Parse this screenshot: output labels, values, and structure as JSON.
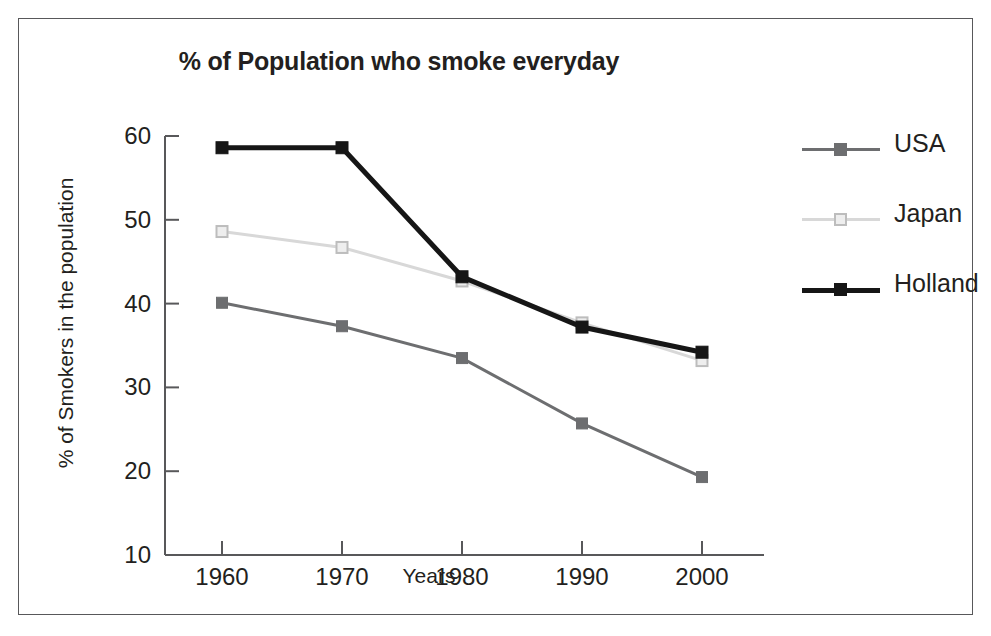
{
  "figure": {
    "title": "% of Population who smoke everyday",
    "border_color": "#58585a",
    "background": "#ffffff"
  },
  "axes": {
    "x_title": "Years",
    "y_title": "% of Smokers in the population",
    "x_tick_labels": [
      "1960",
      "1970",
      "1980",
      "1990",
      "2000"
    ],
    "y_tick_labels": [
      "60",
      "50",
      "40",
      "30",
      "20",
      "10"
    ]
  },
  "legend": {
    "position": "right",
    "entries": [
      {
        "label": "USA",
        "color": "#6d6e70",
        "marker": "filled-square"
      },
      {
        "label": "Japan",
        "color": "#d8d8d8",
        "marker": "open-square"
      },
      {
        "label": "Holland",
        "color": "#161616",
        "marker": "filled-square"
      }
    ]
  },
  "chart_data": {
    "type": "line",
    "title": "% of Population who smoke everyday",
    "xlabel": "Years",
    "ylabel": "% of Smokers in the population",
    "x": [
      1960,
      1970,
      1980,
      1990,
      2000
    ],
    "categories": [
      "1960",
      "1970",
      "1980",
      "1990",
      "2000"
    ],
    "xlim": [
      1955,
      2005
    ],
    "ylim": [
      10,
      60
    ],
    "yticks": [
      10,
      20,
      30,
      40,
      50,
      60
    ],
    "grid": false,
    "legend_position": "right",
    "series": [
      {
        "name": "USA",
        "color": "#6d6e70",
        "marker": "filled-square",
        "values": [
          40.1,
          37.3,
          33.5,
          25.7,
          19.3
        ]
      },
      {
        "name": "Japan",
        "color": "#d8d8d8",
        "marker": "open-square",
        "values": [
          48.6,
          46.7,
          42.7,
          37.7,
          33.2
        ]
      },
      {
        "name": "Holland",
        "color": "#161616",
        "marker": "filled-square",
        "values": [
          58.6,
          58.6,
          43.2,
          37.2,
          34.2
        ]
      }
    ]
  }
}
